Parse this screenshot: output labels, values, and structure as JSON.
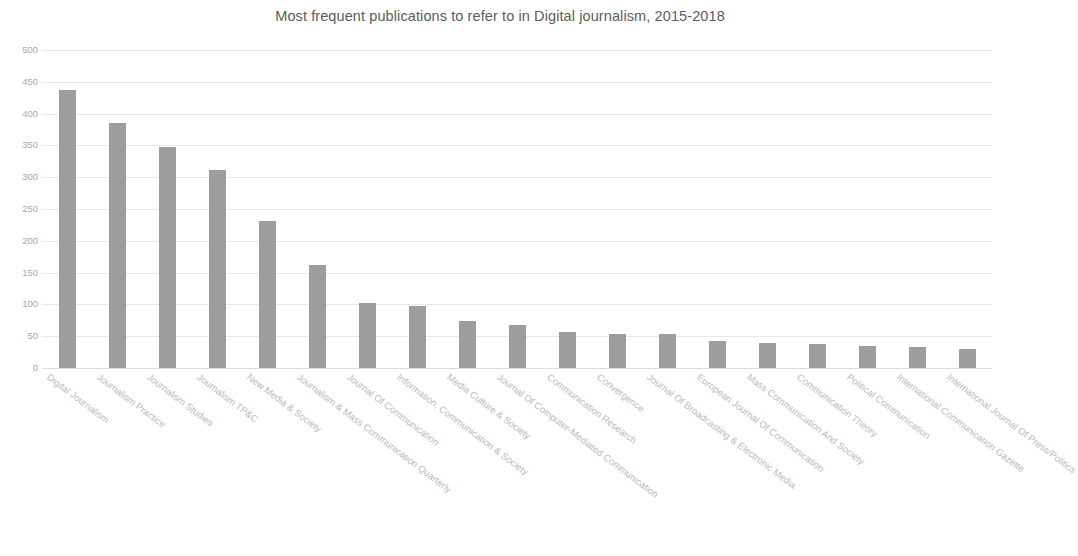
{
  "chart_data": {
    "type": "bar",
    "title": "Most frequent publications to refer to in Digital journalism, 2015-2018",
    "xlabel": "",
    "ylabel": "",
    "ylim": [
      0,
      500
    ],
    "ytick_values": [
      0,
      50,
      100,
      150,
      200,
      250,
      300,
      350,
      400,
      450,
      500
    ],
    "ytick_labels": [
      "0",
      "50",
      "100",
      "150",
      "200",
      "250",
      "300",
      "350",
      "400",
      "450",
      "500"
    ],
    "grid": true,
    "legend": false,
    "bar_color": "#9d9d9d",
    "title_color": "#5c5c5c",
    "tick_color": "#a8a8a8",
    "xlabel_color": "#b9b9b9",
    "gridline_color": "#e8e8e8",
    "background_color": "#ffffff",
    "xtick_rotation_deg": 37,
    "categories": [
      "Digital Journalism",
      "Journalism Practice",
      "Journalism Studies",
      "Journalism TP&C",
      "New Media & Society",
      "Journalism & Mass Communication Quarterly",
      "Journal Of Communication",
      "Information, Communication & Society",
      "Media Culture & Society",
      "Journal Of Computer-Mediated Communication",
      "Communication Research",
      "Convergence",
      "Journal Of Broadcasting & Electronic Media",
      "European Journal Of Communication",
      "Mass Communication And Society",
      "Communication Theory",
      "Political Communication",
      "International Communication Gazette",
      "International Journal Of Press/Politics"
    ],
    "values": [
      437,
      386,
      347,
      312,
      231,
      162,
      103,
      97,
      74,
      68,
      57,
      54,
      54,
      43,
      40,
      38,
      34,
      33,
      30
    ]
  }
}
